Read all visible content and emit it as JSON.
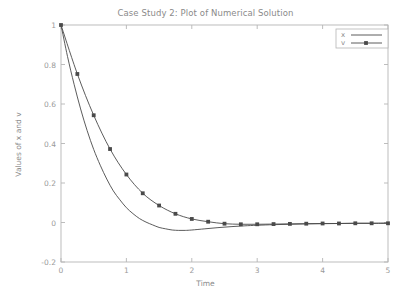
{
  "chart_data": {
    "type": "line",
    "title": "Case Study 2: Plot of Numerical Solution",
    "xlabel": "Time",
    "ylabel": "Values of x and v",
    "xlim": [
      0,
      5
    ],
    "ylim": [
      -0.2,
      1.0
    ],
    "xticks": [
      "0",
      "1",
      "2",
      "3",
      "4",
      "5"
    ],
    "xtick_values": [
      0,
      1,
      2,
      3,
      4,
      5
    ],
    "yticks": [
      "1",
      "0.8",
      "0.6",
      "0.4",
      "0.2",
      "0",
      "-0.2"
    ],
    "ytick_values": [
      1,
      0.8,
      0.6,
      0.4,
      0.2,
      0,
      -0.2
    ],
    "grid": false,
    "legend_position": "top-right",
    "series": [
      {
        "name": "x",
        "marker": "none",
        "color": "#4a4a4a",
        "x": [
          0,
          0.1,
          0.2,
          0.3,
          0.4,
          0.5,
          0.6,
          0.7,
          0.8,
          0.9,
          1.0,
          1.1,
          1.2,
          1.3,
          1.4,
          1.5,
          1.6,
          1.7,
          1.8,
          1.9,
          2.0,
          2.2,
          2.4,
          2.6,
          2.8,
          3.0,
          3.25,
          3.5,
          3.75,
          4.0,
          4.25,
          4.5,
          4.75,
          5.0
        ],
        "values": [
          1.0,
          0.84,
          0.7,
          0.575,
          0.465,
          0.37,
          0.29,
          0.22,
          0.16,
          0.115,
          0.075,
          0.045,
          0.02,
          0.002,
          -0.012,
          -0.025,
          -0.032,
          -0.038,
          -0.04,
          -0.04,
          -0.038,
          -0.032,
          -0.026,
          -0.021,
          -0.017,
          -0.014,
          -0.011,
          -0.009,
          -0.007,
          -0.006,
          -0.005,
          -0.004,
          -0.004,
          -0.003
        ]
      },
      {
        "name": "v",
        "marker": "square",
        "color": "#4a4a4a",
        "x": [
          0,
          0.25,
          0.5,
          0.75,
          1.0,
          1.25,
          1.5,
          1.75,
          2.0,
          2.25,
          2.5,
          2.75,
          3.0,
          3.25,
          3.5,
          3.75,
          4.0,
          4.25,
          4.5,
          4.75,
          5.0
        ],
        "values": [
          1.0,
          0.752,
          0.543,
          0.372,
          0.243,
          0.148,
          0.086,
          0.044,
          0.018,
          0.004,
          -0.006,
          -0.009,
          -0.009,
          -0.008,
          -0.007,
          -0.006,
          -0.005,
          -0.005,
          -0.004,
          -0.004,
          -0.004
        ]
      }
    ]
  },
  "legend": {
    "entries": [
      {
        "label": "x"
      },
      {
        "label": "v"
      }
    ]
  },
  "colors": {
    "axis": "#b5b5b5",
    "text": "#8a8a8a",
    "line": "#4a4a4a",
    "background": "#ffffff"
  }
}
